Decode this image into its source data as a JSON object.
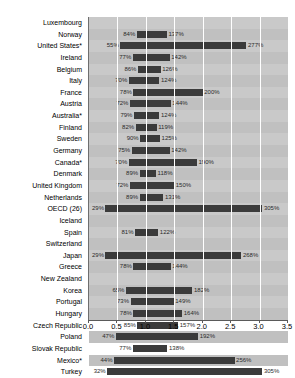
{
  "chart_data": {
    "type": "bar",
    "subtype": "range-bar-horizontal",
    "title": "",
    "subtitle": "",
    "xlabel": "",
    "ylabel": "",
    "xlim": [
      0.0,
      3.5
    ],
    "xticks": [
      "0.0",
      "0.5",
      "1.0",
      "1.5",
      "2.0",
      "2.5",
      "3.0",
      "3.5"
    ],
    "xtick_values": [
      0.0,
      0.5,
      1.0,
      1.5,
      2.0,
      2.5,
      3.0,
      3.5
    ],
    "grid": true,
    "legend": "none",
    "value_unit": "percent",
    "categories": [
      "Luxembourg",
      "Norway",
      "United States*",
      "Ireland",
      "Belgium",
      "Italy",
      "France",
      "Austria",
      "Australia*",
      "Finland",
      "Sweden",
      "Germany",
      "Canada*",
      "Denmark",
      "United Kingdom",
      "Netherlands",
      "OECD (26)",
      "Iceland",
      "Spain",
      "Switzerland",
      "Japan",
      "Greece",
      "New Zealand",
      "Korea",
      "Portugal",
      "Hungary",
      "Czech Republic",
      "Poland",
      "Slovak Republic",
      "Mexico*",
      "Turkey"
    ],
    "bars": [
      {
        "category": "Luxembourg",
        "start": null,
        "end": null,
        "start_label": "",
        "end_label": ""
      },
      {
        "category": "Norway",
        "start": 84,
        "end": 137,
        "start_label": "84%",
        "end_label": "137%"
      },
      {
        "category": "United States*",
        "start": 55,
        "end": 277,
        "start_label": "55%",
        "end_label": "277%"
      },
      {
        "category": "Ireland",
        "start": 77,
        "end": 142,
        "start_label": "77%",
        "end_label": "142%"
      },
      {
        "category": "Belgium",
        "start": 86,
        "end": 126,
        "start_label": "86%",
        "end_label": "126%"
      },
      {
        "category": "Italy",
        "start": 70,
        "end": 124,
        "start_label": "70%",
        "end_label": "124%"
      },
      {
        "category": "France",
        "start": 78,
        "end": 200,
        "start_label": "78%",
        "end_label": "200%"
      },
      {
        "category": "Austria",
        "start": 72,
        "end": 144,
        "start_label": "72%",
        "end_label": "144%"
      },
      {
        "category": "Australia*",
        "start": 79,
        "end": 124,
        "start_label": "79%",
        "end_label": "124%"
      },
      {
        "category": "Finland",
        "start": 82,
        "end": 119,
        "start_label": "82%",
        "end_label": "119%"
      },
      {
        "category": "Sweden",
        "start": 90,
        "end": 125,
        "start_label": "90%",
        "end_label": "125%"
      },
      {
        "category": "Germany",
        "start": 75,
        "end": 142,
        "start_label": "75%",
        "end_label": "142%"
      },
      {
        "category": "Canada*",
        "start": 70,
        "end": 190,
        "start_label": "70%",
        "end_label": "190%"
      },
      {
        "category": "Denmark",
        "start": 89,
        "end": 118,
        "start_label": "89%",
        "end_label": "118%"
      },
      {
        "category": "United Kingdom",
        "start": 72,
        "end": 150,
        "start_label": "72%",
        "end_label": "150%"
      },
      {
        "category": "Netherlands",
        "start": 89,
        "end": 131,
        "start_label": "89%",
        "end_label": "131%"
      },
      {
        "category": "OECD (26)",
        "start": 29,
        "end": 305,
        "start_label": "29%",
        "end_label": "305%"
      },
      {
        "category": "Iceland",
        "start": null,
        "end": null,
        "start_label": "",
        "end_label": ""
      },
      {
        "category": "Spain",
        "start": 81,
        "end": 122,
        "start_label": "81%",
        "end_label": "122%"
      },
      {
        "category": "Switzerland",
        "start": null,
        "end": null,
        "start_label": "",
        "end_label": ""
      },
      {
        "category": "Japan",
        "start": 29,
        "end": 268,
        "start_label": "29%",
        "end_label": "268%"
      },
      {
        "category": "Greece",
        "start": 78,
        "end": 144,
        "start_label": "78%",
        "end_label": "144%"
      },
      {
        "category": "New Zealand",
        "start": null,
        "end": null,
        "start_label": "",
        "end_label": ""
      },
      {
        "category": "Korea",
        "start": 65,
        "end": 182,
        "start_label": "65%",
        "end_label": "182%"
      },
      {
        "category": "Portugal",
        "start": 73,
        "end": 149,
        "start_label": "73%",
        "end_label": "149%"
      },
      {
        "category": "Hungary",
        "start": 78,
        "end": 164,
        "start_label": "78%",
        "end_label": "164%"
      },
      {
        "category": "Czech Republic",
        "start": 85,
        "end": 157,
        "start_label": "85%",
        "end_label": "157%"
      },
      {
        "category": "Poland",
        "start": 47,
        "end": 192,
        "start_label": "47%",
        "end_label": "192%"
      },
      {
        "category": "Slovak Republic",
        "start": 77,
        "end": 138,
        "start_label": "77%",
        "end_label": "138%"
      },
      {
        "category": "Mexico*",
        "start": 44,
        "end": 256,
        "start_label": "44%",
        "end_label": "256%"
      },
      {
        "category": "Turkey",
        "start": 32,
        "end": 305,
        "start_label": "32%",
        "end_label": "305%"
      }
    ],
    "colors": {
      "bar": "#3b3b3b",
      "plot_background": "#c9c9c9",
      "row_alt_background": "#c0c0c0",
      "gridline": "#ffffff",
      "axis": "#5a5a5a",
      "label_text": "#000000",
      "value_text": "#2a2a2a"
    }
  }
}
